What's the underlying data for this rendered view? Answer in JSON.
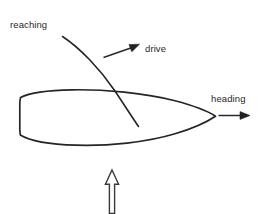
{
  "diagram": {
    "background_color": "#ffffff",
    "ink_color": "#252525",
    "labels": {
      "reaching": "reaching",
      "drive": "drive",
      "heading": "heading"
    },
    "elements": {
      "hull_name": "boat-hull",
      "sail_name": "sail-curve",
      "wind_arrow_name": "wind-direction-arrow",
      "drive_arrow_name": "drive-force-arrow",
      "heading_arrow_name": "heading-direction-arrow",
      "reaching_leader_name": "reaching-leader-line"
    }
  }
}
